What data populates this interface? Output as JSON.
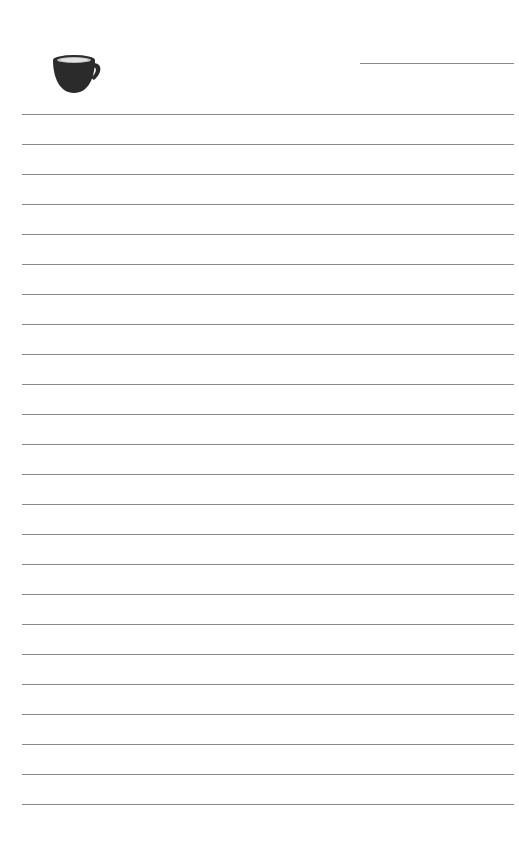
{
  "page": {
    "type": "lined-notepaper",
    "background_color": "#ffffff",
    "line_color": "#8a8a8a",
    "cup_color": "#2b2b2b"
  },
  "header": {
    "icon": "coffee-cup-icon",
    "title_line": ""
  },
  "lines": {
    "count": 24,
    "first_y": 114,
    "spacing": 30,
    "left": 22,
    "right": 514
  }
}
